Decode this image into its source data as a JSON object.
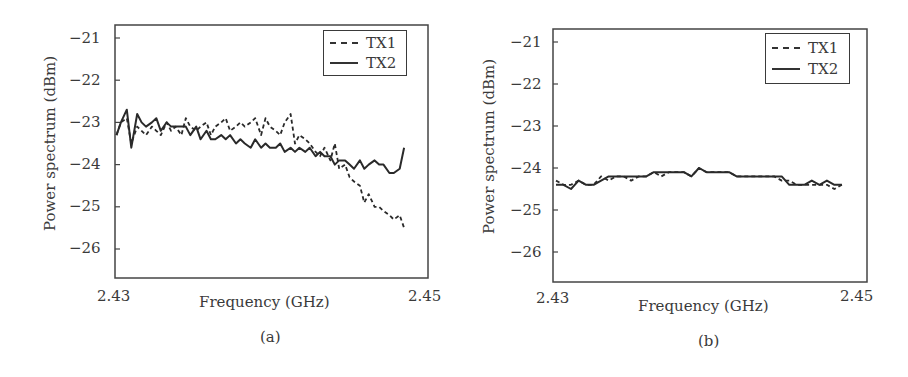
{
  "figure": {
    "panels": [
      {
        "caption": "(a)",
        "ylabel": "Power spectrum (dBm)",
        "xlabel": "Frequency (GHz)",
        "xticks": [
          "2.43",
          "2.45"
        ],
        "yticks": [
          "-21",
          "-22",
          "-23",
          "-24",
          "-25",
          "-26"
        ],
        "legend": [
          "TX1",
          "TX2"
        ]
      },
      {
        "caption": "(b)",
        "ylabel": "Power spectrum (dBm)",
        "xlabel": "Frequency (GHz)",
        "xticks": [
          "2.43",
          "2.45"
        ],
        "yticks": [
          "-21",
          "-22",
          "-23",
          "-24",
          "-25",
          "-26"
        ],
        "legend": [
          "TX1",
          "TX2"
        ]
      }
    ]
  },
  "chart_data": [
    {
      "type": "line",
      "title": "(a)",
      "xlabel": "Frequency (GHz)",
      "ylabel": "Power spectrum (dBm)",
      "xlim": [
        2.43,
        2.45
      ],
      "ylim": [
        -26.7,
        -20.7
      ],
      "xticks": [
        2.43,
        2.45
      ],
      "yticks": [
        -21,
        -22,
        -23,
        -24,
        -25,
        -26
      ],
      "grid": false,
      "legend_position": "upper right",
      "series": [
        {
          "name": "TX1",
          "style": "dashed",
          "x": [
            2.4299,
            2.4302,
            2.4306,
            2.4309,
            2.4313,
            2.4316,
            2.4319,
            2.4323,
            2.4326,
            2.4329,
            2.4333,
            2.4336,
            2.4339,
            2.4343,
            2.4346,
            2.4349,
            2.4353,
            2.4356,
            2.436,
            2.4363,
            2.4366,
            2.437,
            2.4373,
            2.4376,
            2.438,
            2.4383,
            2.4386,
            2.439,
            2.4393,
            2.4397,
            2.44,
            2.4403,
            2.4407,
            2.441,
            2.4413,
            2.4417,
            2.442,
            2.4423,
            2.4427,
            2.443,
            2.4434,
            2.4437,
            2.444,
            2.4444,
            2.4447,
            2.445,
            2.4454,
            2.4457,
            2.446,
            2.4464,
            2.4467,
            2.447,
            2.4474,
            2.4477,
            2.448,
            2.4484,
            2.4487,
            2.4491,
            2.4494
          ],
          "y": [
            -23.3,
            -23.0,
            -22.9,
            -23.5,
            -23.1,
            -23.2,
            -23.3,
            -23.1,
            -23.2,
            -23.3,
            -23.0,
            -23.2,
            -23.1,
            -23.3,
            -22.9,
            -23.1,
            -23.2,
            -23.1,
            -23.0,
            -23.3,
            -23.1,
            -23.0,
            -22.9,
            -23.2,
            -23.1,
            -23.0,
            -23.1,
            -23.0,
            -22.9,
            -23.3,
            -22.9,
            -23.1,
            -23.2,
            -23.3,
            -23.0,
            -22.8,
            -23.5,
            -23.3,
            -23.4,
            -23.5,
            -23.7,
            -23.8,
            -23.6,
            -23.9,
            -23.5,
            -24.1,
            -24.0,
            -24.3,
            -24.4,
            -24.5,
            -24.9,
            -24.7,
            -25.0,
            -25.0,
            -25.1,
            -25.2,
            -25.3,
            -25.2,
            -25.5
          ]
        },
        {
          "name": "TX2",
          "style": "solid",
          "x": [
            2.4299,
            2.4302,
            2.4306,
            2.4309,
            2.4313,
            2.4316,
            2.4319,
            2.4323,
            2.4326,
            2.4329,
            2.4333,
            2.4336,
            2.4339,
            2.4343,
            2.4346,
            2.4349,
            2.4353,
            2.4356,
            2.436,
            2.4363,
            2.4366,
            2.437,
            2.4373,
            2.4376,
            2.438,
            2.4383,
            2.4386,
            2.439,
            2.4393,
            2.4397,
            2.44,
            2.4403,
            2.4407,
            2.441,
            2.4413,
            2.4417,
            2.442,
            2.4423,
            2.4427,
            2.443,
            2.4434,
            2.4437,
            2.444,
            2.4444,
            2.4447,
            2.445,
            2.4454,
            2.4457,
            2.446,
            2.4464,
            2.4467,
            2.447,
            2.4474,
            2.4477,
            2.448,
            2.4484,
            2.4487,
            2.4491,
            2.4494
          ],
          "y": [
            -23.3,
            -23.0,
            -22.7,
            -23.6,
            -22.8,
            -23.0,
            -23.1,
            -23.0,
            -22.9,
            -23.2,
            -23.0,
            -23.1,
            -23.1,
            -23.1,
            -23.1,
            -23.3,
            -23.1,
            -23.4,
            -23.2,
            -23.4,
            -23.4,
            -23.3,
            -23.4,
            -23.3,
            -23.5,
            -23.4,
            -23.5,
            -23.6,
            -23.4,
            -23.6,
            -23.5,
            -23.6,
            -23.6,
            -23.5,
            -23.7,
            -23.6,
            -23.7,
            -23.6,
            -23.7,
            -23.6,
            -23.8,
            -23.7,
            -23.8,
            -23.8,
            -24.0,
            -23.9,
            -23.9,
            -24.0,
            -24.1,
            -23.9,
            -24.1,
            -24.0,
            -23.9,
            -24.0,
            -24.0,
            -24.2,
            -24.2,
            -24.1,
            -23.6
          ]
        }
      ]
    },
    {
      "type": "line",
      "title": "(b)",
      "xlabel": "Frequency (GHz)",
      "ylabel": "Power spectrum (dBm)",
      "xlim": [
        2.43,
        2.45
      ],
      "ylim": [
        -26.7,
        -20.7
      ],
      "xticks": [
        2.43,
        2.45
      ],
      "yticks": [
        -21,
        -22,
        -23,
        -24,
        -25,
        -26
      ],
      "grid": false,
      "legend_position": "upper right",
      "series": [
        {
          "name": "TX1",
          "style": "dashed",
          "x": [
            2.43,
            2.4305,
            2.431,
            2.4315,
            2.432,
            2.4325,
            2.433,
            2.4335,
            2.434,
            2.4345,
            2.435,
            2.4355,
            2.436,
            2.4365,
            2.437,
            2.4375,
            2.438,
            2.4385,
            2.439,
            2.4395,
            2.44,
            2.4405,
            2.441,
            2.4415,
            2.442,
            2.4425,
            2.443,
            2.4435,
            2.444,
            2.4445,
            2.445,
            2.4455,
            2.446,
            2.4465,
            2.447,
            2.4475,
            2.448,
            2.4485,
            2.449
          ],
          "y": [
            -24.3,
            -24.4,
            -24.4,
            -24.3,
            -24.4,
            -24.4,
            -24.2,
            -24.3,
            -24.2,
            -24.2,
            -24.3,
            -24.2,
            -24.2,
            -24.1,
            -24.2,
            -24.1,
            -24.1,
            -24.1,
            -24.2,
            -24.0,
            -24.1,
            -24.1,
            -24.1,
            -24.1,
            -24.2,
            -24.2,
            -24.2,
            -24.2,
            -24.2,
            -24.2,
            -24.3,
            -24.3,
            -24.4,
            -24.4,
            -24.4,
            -24.4,
            -24.4,
            -24.5,
            -24.4
          ]
        },
        {
          "name": "TX2",
          "style": "solid",
          "x": [
            2.43,
            2.4305,
            2.431,
            2.4315,
            2.432,
            2.4325,
            2.433,
            2.4335,
            2.434,
            2.4345,
            2.435,
            2.4355,
            2.436,
            2.4365,
            2.437,
            2.4375,
            2.438,
            2.4385,
            2.439,
            2.4395,
            2.44,
            2.4405,
            2.441,
            2.4415,
            2.442,
            2.4425,
            2.443,
            2.4435,
            2.444,
            2.4445,
            2.445,
            2.4455,
            2.446,
            2.4465,
            2.447,
            2.4475,
            2.448,
            2.4485,
            2.449
          ],
          "y": [
            -24.4,
            -24.4,
            -24.5,
            -24.3,
            -24.4,
            -24.4,
            -24.3,
            -24.2,
            -24.2,
            -24.2,
            -24.2,
            -24.2,
            -24.2,
            -24.1,
            -24.1,
            -24.1,
            -24.1,
            -24.1,
            -24.2,
            -24.0,
            -24.1,
            -24.1,
            -24.1,
            -24.1,
            -24.2,
            -24.2,
            -24.2,
            -24.2,
            -24.2,
            -24.2,
            -24.2,
            -24.4,
            -24.4,
            -24.4,
            -24.3,
            -24.4,
            -24.3,
            -24.4,
            -24.4
          ]
        }
      ]
    }
  ]
}
